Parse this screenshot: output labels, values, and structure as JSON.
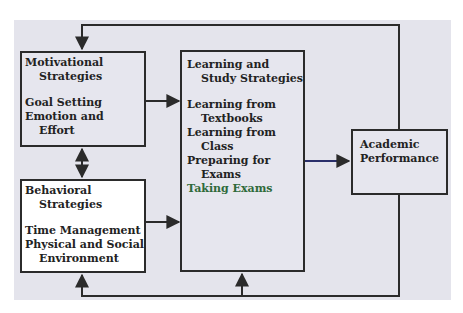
{
  "diagram": {
    "nodes": {
      "motivational": {
        "title_line1": "Motivational",
        "title_line2": "Strategies",
        "items": [
          "Goal Setting",
          "Emotion and",
          "Effort"
        ]
      },
      "behavioral": {
        "title_line1": "Behavioral",
        "title_line2": "Strategies",
        "items": [
          "Time Management",
          "Physical and Social",
          "Environment"
        ]
      },
      "learning": {
        "title_line1": "Learning and",
        "title_line2": "Study Strategies",
        "items": [
          "Learning from",
          "Textbooks",
          "Learning from",
          "Class",
          "Preparing for",
          "Exams",
          "Taking Exams"
        ]
      },
      "academic": {
        "title_line1": "Academic",
        "title_line2": "Performance"
      }
    },
    "edges": [
      {
        "from": "motivational",
        "to": "learning",
        "type": "arrow"
      },
      {
        "from": "behavioral",
        "to": "learning",
        "type": "arrow"
      },
      {
        "from": "motivational",
        "to": "behavioral",
        "type": "double-arrow"
      },
      {
        "from": "learning",
        "to": "academic",
        "type": "arrow"
      },
      {
        "from": "academic",
        "to": "motivational",
        "type": "feedback-arrow",
        "route": "top"
      },
      {
        "from": "academic",
        "to": "behavioral",
        "type": "feedback-arrow",
        "route": "bottom"
      },
      {
        "from": "academic",
        "to": "learning",
        "type": "feedback-arrow",
        "route": "bottom"
      }
    ],
    "colors": {
      "background": "#e4e4ec",
      "box_fill": "#e6e6ee",
      "behavioral_fill": "#ffffff",
      "line": "#2b2b2b",
      "accent_text": "#2f6a3a"
    }
  }
}
